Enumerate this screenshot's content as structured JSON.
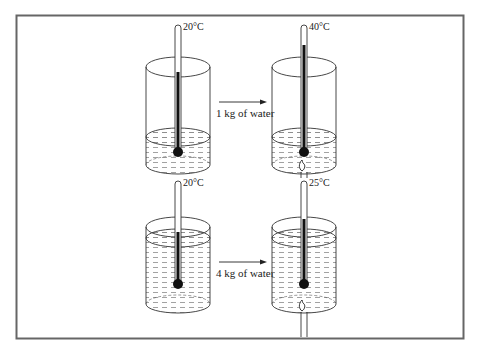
{
  "diagram": {
    "colors": {
      "line": "#333333",
      "frame": "#666666",
      "fill_dark": "#111111",
      "water_dash": "#8a8a8a"
    },
    "rows": [
      {
        "before": {
          "temperature": "20°C"
        },
        "arrow_label": "1 kg of water",
        "after": {
          "temperature": "40°C"
        },
        "water_level": "low"
      },
      {
        "before": {
          "temperature": "20°C"
        },
        "arrow_label": "4 kg of water",
        "after": {
          "temperature": "25°C"
        },
        "water_level": "high"
      }
    ]
  }
}
